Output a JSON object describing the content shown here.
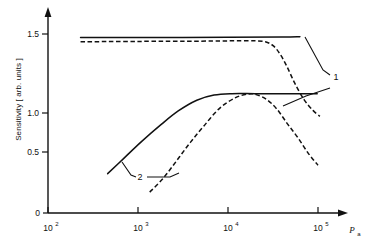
{
  "chart_data": {
    "type": "line",
    "title": "",
    "xlabel": "P_a",
    "xlabel_base": "P",
    "xlabel_sub": "a",
    "ylabel": "Sensitivity [ arb. units ]",
    "xscale": "log",
    "xlim": [
      100,
      100000
    ],
    "ylim": [
      0,
      1.62
    ],
    "grid": false,
    "legend": "none",
    "xticks": [
      {
        "label_base": "10",
        "label_exp": "2",
        "value": 100
      },
      {
        "label_base": "10",
        "label_exp": "3",
        "value": 1000
      },
      {
        "label_base": "10",
        "label_exp": "4",
        "value": 10000
      },
      {
        "label_base": "10",
        "label_exp": "5",
        "value": 100000
      }
    ],
    "yticks": [
      {
        "label": "0",
        "value": 0
      },
      {
        "label": "0.5",
        "value": 0.5
      },
      {
        "label": "1.0",
        "value": 1.0
      },
      {
        "label": "1.5",
        "value": 1.5
      }
    ],
    "annotations": [
      {
        "text": "1",
        "x": 70000,
        "y": 1.19
      },
      {
        "text": "2",
        "x": 1450,
        "y": 0.47
      }
    ],
    "series": [
      {
        "name": "curve-1-solid",
        "style": "solid",
        "label": "1",
        "points": [
          [
            230,
            1.47
          ],
          [
            1000,
            1.47
          ],
          [
            10000,
            1.472
          ],
          [
            40000,
            1.475
          ],
          [
            63000,
            1.478
          ]
        ]
      },
      {
        "name": "curve-1-dashed",
        "style": "dashed",
        "label": "1",
        "points": [
          [
            230,
            1.435
          ],
          [
            1000,
            1.438
          ],
          [
            5000,
            1.44
          ],
          [
            12000,
            1.443
          ],
          [
            20000,
            1.443
          ],
          [
            26000,
            1.435
          ],
          [
            32000,
            1.4
          ],
          [
            38000,
            1.33
          ],
          [
            45000,
            1.23
          ],
          [
            55000,
            1.09
          ],
          [
            70000,
            0.95
          ],
          [
            88000,
            0.86
          ],
          [
            105000,
            0.81
          ]
        ]
      },
      {
        "name": "curve-2-solid",
        "style": "solid",
        "label": "2",
        "points": [
          [
            460,
            0.33
          ],
          [
            700,
            0.46
          ],
          [
            1100,
            0.6
          ],
          [
            1800,
            0.74
          ],
          [
            2800,
            0.855
          ],
          [
            4500,
            0.945
          ],
          [
            7000,
            0.988
          ],
          [
            11000,
            1.0
          ],
          [
            20000,
            1.0
          ],
          [
            40000,
            1.0
          ],
          [
            70000,
            1.0
          ],
          [
            98000,
            1.0
          ]
        ]
      },
      {
        "name": "curve-2-dashed",
        "style": "dashed",
        "label": "2",
        "points": [
          [
            1350,
            0.175
          ],
          [
            1900,
            0.29
          ],
          [
            2700,
            0.44
          ],
          [
            3800,
            0.59
          ],
          [
            5400,
            0.73
          ],
          [
            8000,
            0.875
          ],
          [
            12000,
            0.965
          ],
          [
            17000,
            0.998
          ],
          [
            21000,
            0.99
          ],
          [
            27000,
            0.95
          ],
          [
            35000,
            0.87
          ],
          [
            46000,
            0.745
          ],
          [
            60000,
            0.63
          ],
          [
            78000,
            0.5
          ],
          [
            100000,
            0.4
          ]
        ]
      }
    ]
  },
  "axes": {
    "y_axis_name": "y-axis",
    "x_axis_name": "x-axis"
  }
}
